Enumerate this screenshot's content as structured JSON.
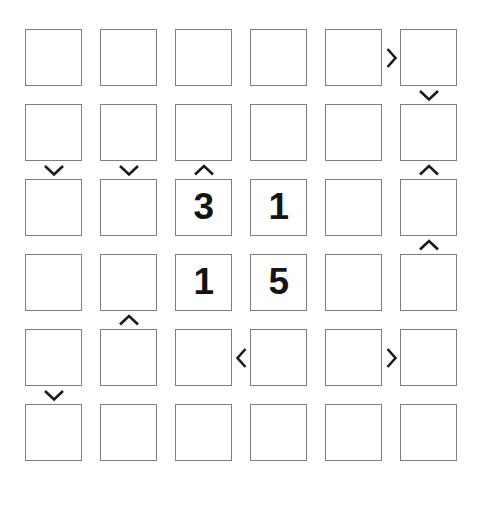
{
  "puzzle": {
    "title": "Futoshiki Grid Puzzle",
    "type": "futoshiki",
    "rows": 6,
    "cols": 6,
    "colors": {
      "background": "#ffffff",
      "cell_fill": "#ffffff",
      "cell_border": "#7d7d82",
      "digit": "#141414",
      "constraint": "#1b1b1b"
    },
    "geometry": {
      "cell_size": 57,
      "gap": 18,
      "origin_x": 25,
      "origin_y": 29
    },
    "cells": [
      [
        {
          "row": 1,
          "col": 1,
          "value": ""
        },
        {
          "row": 1,
          "col": 2,
          "value": ""
        },
        {
          "row": 1,
          "col": 3,
          "value": ""
        },
        {
          "row": 1,
          "col": 4,
          "value": ""
        },
        {
          "row": 1,
          "col": 5,
          "value": ""
        },
        {
          "row": 1,
          "col": 6,
          "value": ""
        }
      ],
      [
        {
          "row": 2,
          "col": 1,
          "value": ""
        },
        {
          "row": 2,
          "col": 2,
          "value": ""
        },
        {
          "row": 2,
          "col": 3,
          "value": ""
        },
        {
          "row": 2,
          "col": 4,
          "value": ""
        },
        {
          "row": 2,
          "col": 5,
          "value": ""
        },
        {
          "row": 2,
          "col": 6,
          "value": ""
        }
      ],
      [
        {
          "row": 3,
          "col": 1,
          "value": ""
        },
        {
          "row": 3,
          "col": 2,
          "value": ""
        },
        {
          "row": 3,
          "col": 3,
          "value": "3"
        },
        {
          "row": 3,
          "col": 4,
          "value": "1"
        },
        {
          "row": 3,
          "col": 5,
          "value": ""
        },
        {
          "row": 3,
          "col": 6,
          "value": ""
        }
      ],
      [
        {
          "row": 4,
          "col": 1,
          "value": ""
        },
        {
          "row": 4,
          "col": 2,
          "value": ""
        },
        {
          "row": 4,
          "col": 3,
          "value": "1"
        },
        {
          "row": 4,
          "col": 4,
          "value": "5"
        },
        {
          "row": 4,
          "col": 5,
          "value": ""
        },
        {
          "row": 4,
          "col": 6,
          "value": ""
        }
      ],
      [
        {
          "row": 5,
          "col": 1,
          "value": ""
        },
        {
          "row": 5,
          "col": 2,
          "value": ""
        },
        {
          "row": 5,
          "col": 3,
          "value": ""
        },
        {
          "row": 5,
          "col": 4,
          "value": ""
        },
        {
          "row": 5,
          "col": 5,
          "value": ""
        },
        {
          "row": 5,
          "col": 6,
          "value": ""
        }
      ],
      [
        {
          "row": 6,
          "col": 1,
          "value": ""
        },
        {
          "row": 6,
          "col": 2,
          "value": ""
        },
        {
          "row": 6,
          "col": 3,
          "value": ""
        },
        {
          "row": 6,
          "col": 4,
          "value": ""
        },
        {
          "row": 6,
          "col": 5,
          "value": ""
        },
        {
          "row": 6,
          "col": 6,
          "value": ""
        }
      ]
    ],
    "filled_cells": [
      {
        "row": 3,
        "col": 3,
        "value": "3"
      },
      {
        "row": 3,
        "col": 4,
        "value": "1"
      },
      {
        "row": 4,
        "col": 3,
        "value": "1"
      },
      {
        "row": 4,
        "col": 4,
        "value": "5"
      }
    ],
    "constraints": [
      {
        "id": "h-r1-c5c6",
        "orientation": "horizontal",
        "row": 1,
        "col": 5,
        "glyph": ">",
        "symbol": "greater-than",
        "meaning": "left cell greater than right cell"
      },
      {
        "id": "v-r1r2-c6",
        "orientation": "vertical",
        "row": 1,
        "col": 6,
        "glyph": "∨",
        "symbol": "chevron-down",
        "meaning": "upper cell greater than lower cell"
      },
      {
        "id": "v-r2r3-c1",
        "orientation": "vertical",
        "row": 2,
        "col": 1,
        "glyph": "∨",
        "symbol": "chevron-down",
        "meaning": "upper cell greater than lower cell"
      },
      {
        "id": "v-r2r3-c2",
        "orientation": "vertical",
        "row": 2,
        "col": 2,
        "glyph": "∨",
        "symbol": "chevron-down",
        "meaning": "upper cell greater than lower cell"
      },
      {
        "id": "v-r2r3-c3",
        "orientation": "vertical",
        "row": 2,
        "col": 3,
        "glyph": "∧",
        "symbol": "chevron-up",
        "meaning": "lower cell greater than upper cell"
      },
      {
        "id": "v-r2r3-c6",
        "orientation": "vertical",
        "row": 2,
        "col": 6,
        "glyph": "∧",
        "symbol": "chevron-up",
        "meaning": "lower cell greater than upper cell"
      },
      {
        "id": "v-r3r4-c6",
        "orientation": "vertical",
        "row": 3,
        "col": 6,
        "glyph": "∧",
        "symbol": "chevron-up",
        "meaning": "lower cell greater than upper cell"
      },
      {
        "id": "v-r4r5-c2",
        "orientation": "vertical",
        "row": 4,
        "col": 2,
        "glyph": "∧",
        "symbol": "chevron-up",
        "meaning": "lower cell greater than upper cell"
      },
      {
        "id": "h-r5-c3c4",
        "orientation": "horizontal",
        "row": 5,
        "col": 3,
        "glyph": "<",
        "symbol": "less-than",
        "meaning": "right cell greater than left cell"
      },
      {
        "id": "h-r5-c5c6",
        "orientation": "horizontal",
        "row": 5,
        "col": 5,
        "glyph": ">",
        "symbol": "greater-than",
        "meaning": "left cell greater than right cell"
      },
      {
        "id": "v-r5r6-c1",
        "orientation": "vertical",
        "row": 5,
        "col": 1,
        "glyph": "∨",
        "symbol": "chevron-down",
        "meaning": "upper cell greater than lower cell"
      }
    ]
  }
}
